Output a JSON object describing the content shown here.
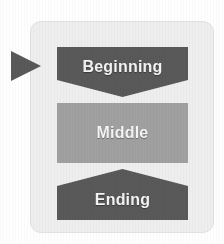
{
  "diagram": {
    "card": {
      "background_color": "#eeeeee",
      "border_color": "#e2e2e2"
    },
    "pointer": {
      "icon": "right-triangle-arrow-icon",
      "color": "#595959",
      "points_at": "Beginning"
    },
    "stages": [
      {
        "id": "beginning",
        "label": "Beginning",
        "shape": "rectangle-with-v-notch-bottom",
        "fill_color": "#595959",
        "text_color": "#f4f4f4"
      },
      {
        "id": "middle",
        "label": "Middle",
        "shape": "rectangle",
        "fill_color": "#a0a0a0",
        "text_color": "#f4f4f4"
      },
      {
        "id": "ending",
        "label": "Ending",
        "shape": "chevron-peaked-top",
        "fill_color": "#595959",
        "text_color": "#f4f4f4"
      }
    ]
  }
}
